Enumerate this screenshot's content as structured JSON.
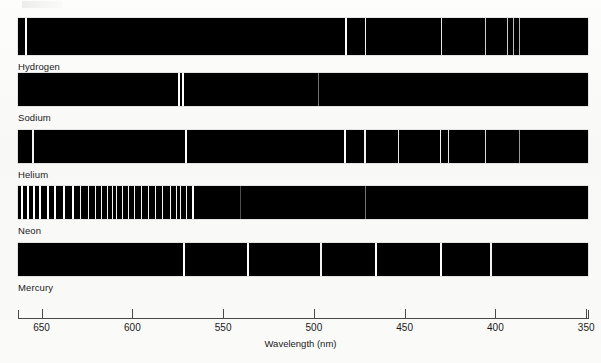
{
  "chart_data": {
    "type": "line",
    "xlabel": "Wavelength (nm)",
    "ylabel": "",
    "xlim": [
      663,
      349
    ],
    "x_ticks": [
      650,
      600,
      550,
      500,
      450,
      400,
      350
    ],
    "x_tick_labels": [
      "650",
      "600",
      "550",
      "500",
      "450",
      "400",
      "350"
    ],
    "grid": false,
    "legend": "none",
    "axis_direction": "decreasing",
    "series": [
      {
        "name": "Hydrogen",
        "label": "Hydrogen",
        "lines_nm": [
          656.3,
          486.1,
          434.0,
          410.2,
          397.0,
          393.5,
          389.0,
          383.5
        ],
        "lines_px": [
          25,
          345,
          365,
          441,
          485,
          507,
          513,
          519
        ],
        "line_widths_px": [
          1.6,
          1.6,
          1.4,
          1.3,
          1.1,
          1.1,
          1.1,
          1.1
        ],
        "line_intensity": [
          1.0,
          1.0,
          0.95,
          0.9,
          0.8,
          0.8,
          0.75,
          0.7
        ]
      },
      {
        "name": "Sodium",
        "label": "Sodium",
        "lines_nm": [
          589.0,
          588.6,
          498.0
        ],
        "lines_px": [
          178,
          182,
          318
        ],
        "line_widths_px": [
          1.7,
          1.7,
          1.0
        ],
        "line_intensity": [
          1.0,
          1.0,
          0.45
        ]
      },
      {
        "name": "Helium",
        "label": "Helium",
        "lines_nm": [
          667.8,
          587.6,
          501.6,
          492.2,
          471.3,
          447.1,
          438.8,
          402.6,
          388.9
        ],
        "lines_px": [
          32,
          185,
          344,
          364,
          398,
          440,
          448,
          485,
          519
        ],
        "line_widths_px": [
          1.5,
          1.6,
          1.6,
          1.5,
          1.3,
          1.4,
          1.3,
          1.2,
          1.0
        ],
        "line_intensity": [
          0.95,
          1.0,
          1.0,
          0.95,
          0.9,
          0.95,
          0.9,
          0.85,
          0.6
        ]
      },
      {
        "name": "Neon",
        "label": "Neon",
        "lines_nm": [
          659,
          656,
          653,
          650,
          645,
          641,
          636,
          631,
          626,
          621,
          618,
          614,
          611,
          609,
          607,
          604,
          601,
          598,
          595,
          591,
          588,
          585,
          582,
          579,
          576,
          574,
          571,
          540,
          498
        ],
        "lines_px": [
          21,
          27,
          33,
          39,
          47,
          54,
          63,
          72,
          80,
          88,
          95,
          101,
          107,
          112,
          116,
          122,
          128,
          134,
          141,
          148,
          155,
          162,
          170,
          176,
          180,
          186,
          192,
          240,
          365
        ],
        "line_widths_px": [
          1.6,
          1.6,
          1.6,
          1.6,
          1.5,
          1.5,
          1.5,
          1.5,
          1.4,
          1.4,
          1.4,
          1.4,
          1.3,
          1.3,
          1.3,
          1.3,
          1.3,
          1.3,
          1.3,
          1.3,
          1.3,
          1.3,
          1.3,
          1.4,
          1.4,
          1.4,
          1.5,
          0.9,
          1.0
        ],
        "line_intensity": [
          1.0,
          1.0,
          1.0,
          1.0,
          1.0,
          1.0,
          1.0,
          1.0,
          0.95,
          0.95,
          0.95,
          0.95,
          0.95,
          0.95,
          0.95,
          0.95,
          0.95,
          0.95,
          0.95,
          0.95,
          0.95,
          0.95,
          0.95,
          0.95,
          0.95,
          0.95,
          1.0,
          0.3,
          0.45
        ]
      },
      {
        "name": "Mercury",
        "label": "Mercury",
        "lines_nm": [
          579.0,
          546.1,
          491.6,
          435.8,
          404.7,
          378.0
        ],
        "lines_px": [
          183,
          247,
          320,
          375,
          440,
          490
        ],
        "line_widths_px": [
          1.7,
          1.6,
          1.5,
          1.6,
          1.6,
          1.6
        ],
        "line_intensity": [
          1.0,
          1.0,
          0.95,
          1.0,
          1.0,
          0.95
        ]
      }
    ]
  },
  "axis": {
    "title": "Wavelength (nm)",
    "ticks": [
      "650",
      "600",
      "550",
      "500",
      "450",
      "400",
      "350"
    ]
  },
  "labels": {
    "hydrogen": "Hydrogen",
    "sodium": "Sodium",
    "helium": "Helium",
    "neon": "Neon",
    "mercury": "Mercury"
  }
}
